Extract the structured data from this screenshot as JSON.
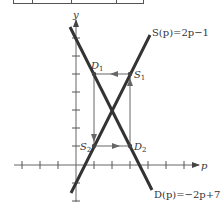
{
  "table_fragment": {
    "bottom_y": 3,
    "columns_x": [
      13,
      32,
      71,
      116,
      143
    ]
  },
  "axes": {
    "x_label": "p",
    "y_label": "y",
    "origin_px": [
      76,
      165
    ],
    "unit_px": 18,
    "x_ticks": [
      -3,
      -2,
      -1,
      1,
      2,
      3,
      4,
      5,
      6
    ],
    "y_ticks": [
      -2,
      -1,
      1,
      2,
      3,
      4,
      5,
      6,
      7
    ]
  },
  "curves": [
    {
      "name": "supply",
      "label": "S(p) = 2p − 1",
      "label_parts": [
        "S(",
        "p",
        ")=2",
        "p",
        "−1"
      ],
      "slope": 2,
      "intercept": -1,
      "p_range": [
        -0.28,
        4.1
      ]
    },
    {
      "name": "demand",
      "label": "D(p) = −2p + 7",
      "label_parts": [
        "D(",
        "p",
        ")=−2",
        "p",
        "+7"
      ],
      "slope": -2,
      "intercept": 7,
      "p_range": [
        -0.33,
        4.2
      ]
    }
  ],
  "points": [
    {
      "id": "D1",
      "letter": "D",
      "sub": "1",
      "p": 1,
      "y": 5
    },
    {
      "id": "S1",
      "letter": "S",
      "sub": "1",
      "p": 3,
      "y": 5
    },
    {
      "id": "S2",
      "letter": "S",
      "sub": "2",
      "p": 1,
      "y": 1
    },
    {
      "id": "D2",
      "letter": "D",
      "sub": "2",
      "p": 3,
      "y": 1
    }
  ],
  "cobweb_arrows": [
    {
      "from": "S1",
      "to": "D1",
      "direction": "left"
    },
    {
      "from": "D1",
      "to": "S2",
      "direction": "down"
    },
    {
      "from": "S2",
      "to": "D2",
      "direction": "right"
    },
    {
      "from": "D2",
      "to": "S1",
      "direction": "up"
    }
  ],
  "equilibrium": {
    "p": 2,
    "y": 3
  },
  "labels": {
    "y_axis": "y",
    "p_axis": "p",
    "supply_eq": "S(p)=2p−1",
    "demand_eq": "D(p)=−2p+7",
    "D1": "D",
    "D1_sub": "1",
    "S1": "S",
    "S1_sub": "1",
    "S2": "S",
    "S2_sub": "2",
    "D2": "D",
    "D2_sub": "2"
  }
}
